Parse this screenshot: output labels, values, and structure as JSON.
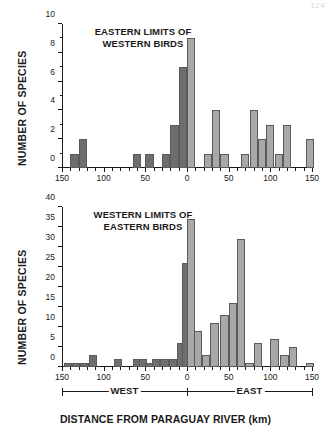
{
  "page": {
    "number": "124"
  },
  "figure": {
    "xaxis_title": "DISTANCE FROM PARAGUAY RIVER (km)",
    "direction_labels": {
      "west": "WEST",
      "east": "EAST"
    }
  },
  "chart_data": [
    {
      "type": "bar",
      "title": "EASTERN LIMITS OF\nWESTERN BIRDS",
      "xlabel": "DISTANCE FROM PARAGUAY RIVER (km)",
      "ylabel": "NUMBER OF SPECIES",
      "ylim": [
        0,
        10
      ],
      "yticks": [
        0,
        2,
        4,
        6,
        8,
        10
      ],
      "ytick_labels": [
        "0",
        "2",
        "4",
        "6",
        "8",
        "10"
      ],
      "yminor_step": 1,
      "xlim": [
        -150,
        150
      ],
      "xticks": [
        -150,
        -100,
        -50,
        0,
        50,
        100,
        150
      ],
      "xtick_labels": [
        "150",
        "100",
        "50",
        "0",
        "50",
        "100",
        "150"
      ],
      "xminor_step": 10,
      "bin_width": 10,
      "grid": false,
      "legend": "none",
      "bar_color_west": "#6e6e6e",
      "bar_color_east": "#a8a8a8",
      "bar_edge_color": "#5a5a5a",
      "bins": [
        {
          "x": -140,
          "value": 1
        },
        {
          "x": -130,
          "value": 2
        },
        {
          "x": -65,
          "value": 1
        },
        {
          "x": -50,
          "value": 1
        },
        {
          "x": -30,
          "value": 1
        },
        {
          "x": -20,
          "value": 3
        },
        {
          "x": -10,
          "value": 7
        },
        {
          "x": 0,
          "value": 9
        },
        {
          "x": 20,
          "value": 1
        },
        {
          "x": 30,
          "value": 4
        },
        {
          "x": 40,
          "value": 1
        },
        {
          "x": 65,
          "value": 1
        },
        {
          "x": 75,
          "value": 4
        },
        {
          "x": 85,
          "value": 2
        },
        {
          "x": 95,
          "value": 3
        },
        {
          "x": 105,
          "value": 1
        },
        {
          "x": 115,
          "value": 3
        },
        {
          "x": 143,
          "value": 2
        }
      ]
    },
    {
      "type": "bar",
      "title": "WESTERN LIMITS OF\nEASTERN BIRDS",
      "xlabel": "DISTANCE FROM PARAGUAY RIVER (km)",
      "ylabel": "NUMBER OF SPECIES",
      "ylim": [
        0,
        40
      ],
      "yticks": [
        0,
        5,
        10,
        15,
        20,
        25,
        30,
        35,
        40
      ],
      "ytick_labels": [
        "0",
        "5",
        "10",
        "15",
        "20",
        "25",
        "30",
        "35",
        "40"
      ],
      "yminor_step": 5,
      "xlim": [
        -150,
        150
      ],
      "xticks": [
        -150,
        -100,
        -50,
        0,
        50,
        100,
        150
      ],
      "xtick_labels": [
        "150",
        "100",
        "50",
        "0",
        "50",
        "100",
        "150"
      ],
      "xminor_step": 10,
      "bin_width": 10,
      "grid": false,
      "legend": "none",
      "bar_color_west": "#6e6e6e",
      "bar_color_east": "#a8a8a8",
      "bar_edge_color": "#5a5a5a",
      "bins": [
        {
          "x": -148,
          "value": 1
        },
        {
          "x": -138,
          "value": 1
        },
        {
          "x": -128,
          "value": 1
        },
        {
          "x": -118,
          "value": 3
        },
        {
          "x": -88,
          "value": 2
        },
        {
          "x": -65,
          "value": 2
        },
        {
          "x": -58,
          "value": 2
        },
        {
          "x": -50,
          "value": 1
        },
        {
          "x": -42,
          "value": 2
        },
        {
          "x": -32,
          "value": 2
        },
        {
          "x": -22,
          "value": 2
        },
        {
          "x": -12,
          "value": 6
        },
        {
          "x": -6,
          "value": 26
        },
        {
          "x": 0,
          "value": 37
        },
        {
          "x": 8,
          "value": 9
        },
        {
          "x": 18,
          "value": 3
        },
        {
          "x": 28,
          "value": 11
        },
        {
          "x": 40,
          "value": 13
        },
        {
          "x": 50,
          "value": 16
        },
        {
          "x": 60,
          "value": 32
        },
        {
          "x": 70,
          "value": 1
        },
        {
          "x": 80,
          "value": 6
        },
        {
          "x": 100,
          "value": 7
        },
        {
          "x": 112,
          "value": 3
        },
        {
          "x": 122,
          "value": 5
        },
        {
          "x": 143,
          "value": 1
        }
      ]
    }
  ]
}
